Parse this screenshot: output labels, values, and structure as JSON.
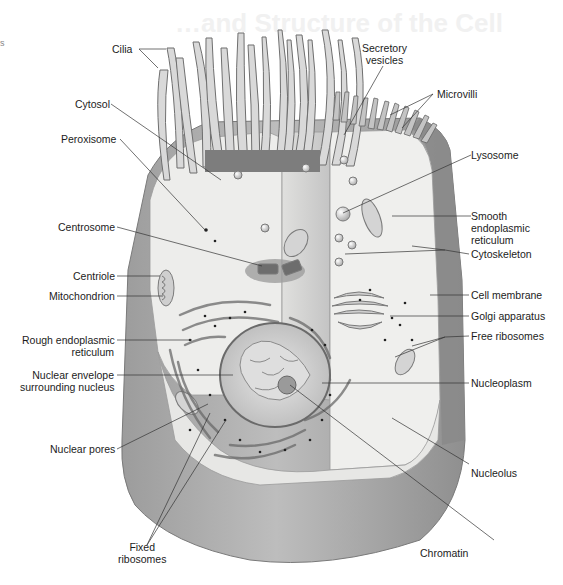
{
  "figure": {
    "ghost_heading": "…and Structure of the Cell",
    "edge_mark": "s",
    "colors": {
      "background": "#ffffff",
      "cell_outer": "#a9a9a9",
      "cell_outer_dark": "#8e8e8e",
      "cytoplasm": "#ececea",
      "cut_face": "#c9c9c9",
      "nucleus": "#d6d6d6",
      "label_text": "#1c1c1c",
      "leader_line": "#333333"
    }
  },
  "labels": {
    "cilia": [
      "Cilia"
    ],
    "secretory_vesicles": [
      "Secretory",
      "vesicles"
    ],
    "microvilli": [
      "Microvilli"
    ],
    "cytosol": [
      "Cytosol"
    ],
    "peroxisome": [
      "Peroxisome"
    ],
    "lysosome": [
      "Lysosome"
    ],
    "centrosome": [
      "Centrosome"
    ],
    "smooth_er": [
      "Smooth",
      "endoplasmic",
      "reticulum"
    ],
    "cytoskeleton": [
      "Cytoskeleton"
    ],
    "centriole": [
      "Centriole"
    ],
    "mitochondrion": [
      "Mitochondrion"
    ],
    "cell_membrane": [
      "Cell membrane"
    ],
    "golgi": [
      "Golgi apparatus"
    ],
    "rough_er": [
      "Rough endoplasmic",
      "reticulum"
    ],
    "free_ribosomes": [
      "Free ribosomes"
    ],
    "nuclear_envelope": [
      "Nuclear envelope",
      "surrounding nucleus"
    ],
    "nucleoplasm": [
      "Nucleoplasm"
    ],
    "nuclear_pores": [
      "Nuclear pores"
    ],
    "nucleolus": [
      "Nucleolus"
    ],
    "fixed_ribosomes": [
      "Fixed",
      "ribosomes"
    ],
    "chromatin": [
      "Chromatin"
    ]
  }
}
